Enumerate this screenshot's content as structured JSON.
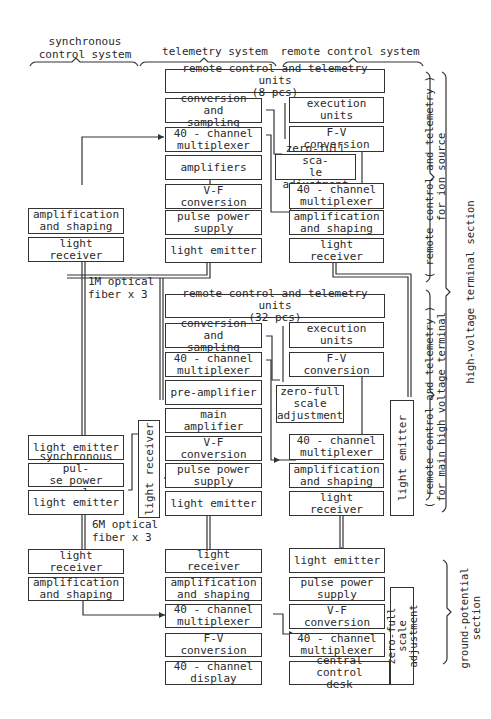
{
  "headers": {
    "sync": "synchronous\ncontrol system",
    "telemetry": "telemetry system",
    "remote": "remote control system"
  },
  "side_labels": {
    "ion_source": "( remote control and telemetry )\nfor ion source",
    "main_terminal": "( remote control and telemetry )\nfor main high voltage terminal",
    "hv_section": "high-voltage terminal section",
    "ground_section": "ground-potential section"
  },
  "fiber_labels": {
    "fiber_1m": "1M optical\nfiber x 3",
    "fiber_6m": "6M optical\nfiber x 3"
  },
  "ion_source": {
    "units": "remote control and telemetry units\n(8 pcs)",
    "conv_sampling": "conversion and\nsampling",
    "mux": "40 - channel\nmultiplexer",
    "amplifiers": "amplifiers",
    "vf": "V-F conversion",
    "pulse_power": "pulse power\nsupply",
    "light_emitter": "light emitter",
    "execution": "execution units",
    "fv": "F-V conversion",
    "zero_full": "zero-full sca-\nle adjustment",
    "mux_rc": "40 - channel\nmultiplexer",
    "amp_shaping": "amplification\nand shaping",
    "light_receiver": "light receiver"
  },
  "sync": {
    "amp_shaping_top": "amplification\nand shaping",
    "light_receiver_top": "light receiver",
    "light_emitter_1": "light emitter",
    "sync_pulse": "synchronous pul-\nse power supply",
    "light_emitter_2": "light emitter",
    "light_receiver_bottom": "light receiver",
    "amp_shaping_bottom": "amplification\nand shaping"
  },
  "main_terminal": {
    "units": "remote control and telemetry units\n(32 pcs)",
    "conv_sampling": "conversion and\nsampling",
    "mux": "40 - channel\nmultiplexer",
    "pre_amp": "pre-amplifier",
    "main_amp": "main amplifier",
    "vf": "V-F conversion",
    "pulse_power": "pulse power\nsupply",
    "light_emitter": "light emitter",
    "execution": "execution units",
    "fv": "F-V conversion",
    "zero_full": "zero-full\nscale\nadjustment",
    "mux_rc": "40 - channel\nmultiplexer",
    "amp_shaping": "amplification\nand shaping",
    "light_receiver": "light receiver",
    "side_light_receiver": "light receiver",
    "side_light_emitter": "light emitter"
  },
  "ground": {
    "t_light_receiver": "light receiver",
    "t_amp_shaping": "amplification\nand shaping",
    "t_mux": "40 - channel\nmultiplexer",
    "t_fv": "F-V conversion",
    "t_display": "40 - channel\ndisplay",
    "r_light_emitter": "light emitter",
    "r_pulse_power": "pulse power\nsupply",
    "r_vf": "V-F conversion",
    "r_mux": "40 - channel\nmultiplexer",
    "r_desk": "central control\ndesk",
    "r_zero_full": "zero-full scale\nadjustment"
  }
}
